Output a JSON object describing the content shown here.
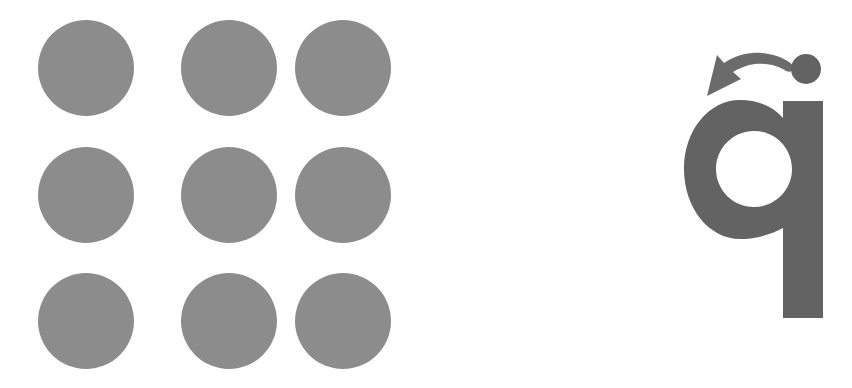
{
  "figure": {
    "background_color": "#ffffff",
    "width": 852,
    "height": 388
  },
  "dot_grid": {
    "name": "dot-grid",
    "rows": 3,
    "columns": 3,
    "count": 9,
    "fill_color": "#8c8c8c",
    "radius": 48,
    "column_centers": [
      86,
      229,
      343
    ],
    "row_centers": [
      68,
      195,
      321
    ],
    "dots": [
      {
        "id": "dot-r1-c1",
        "row": 1,
        "col": 1,
        "cx": 86,
        "cy": 68,
        "r": 48
      },
      {
        "id": "dot-r1-c2",
        "row": 1,
        "col": 2,
        "cx": 229,
        "cy": 68,
        "r": 48
      },
      {
        "id": "dot-r1-c3",
        "row": 1,
        "col": 3,
        "cx": 343,
        "cy": 68,
        "r": 48
      },
      {
        "id": "dot-r2-c1",
        "row": 2,
        "col": 1,
        "cx": 86,
        "cy": 195,
        "r": 48
      },
      {
        "id": "dot-r2-c2",
        "row": 2,
        "col": 2,
        "cx": 229,
        "cy": 195,
        "r": 48
      },
      {
        "id": "dot-r2-c3",
        "row": 2,
        "col": 3,
        "cx": 343,
        "cy": 195,
        "r": 48
      },
      {
        "id": "dot-r3-c1",
        "row": 3,
        "col": 1,
        "cx": 86,
        "cy": 321,
        "r": 48
      },
      {
        "id": "dot-r3-c2",
        "row": 3,
        "col": 2,
        "cx": 229,
        "cy": 321,
        "r": 48
      },
      {
        "id": "dot-r3-c3",
        "row": 3,
        "col": 3,
        "cx": 343,
        "cy": 321,
        "r": 48
      }
    ]
  },
  "glyph": {
    "name": "letter-q-glyph",
    "character": "q",
    "fill_color": "#636363",
    "bowl": {
      "outer_cx": 754,
      "outer_cy": 169,
      "outer_r": 70,
      "counter_r": 38,
      "top": 100,
      "bottom": 238,
      "left": 684,
      "right": 823
    },
    "stem": {
      "left": 783,
      "right": 823,
      "top": 169,
      "bottom": 318,
      "width": 40,
      "height": 149
    }
  },
  "accent_dot": {
    "name": "accent-dot",
    "fill_color": "#636363",
    "cx": 806,
    "cy": 69,
    "r": 15
  },
  "rotation_arrow": {
    "name": "rotation-arrow",
    "fill_color": "#6b6b6b",
    "direction": "counter-clockwise",
    "points_toward": "left",
    "tail_start": {
      "x": 788,
      "y": 69
    },
    "head_tip": {
      "x": 707,
      "y": 95
    },
    "arc_peak": {
      "x": 752,
      "y": 58
    }
  }
}
